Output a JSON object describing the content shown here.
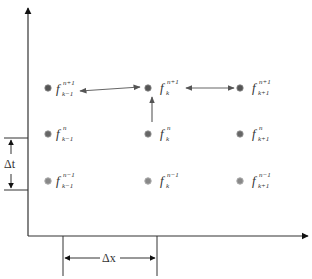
{
  "diagram": {
    "type": "finite-difference-stencil",
    "axes": {
      "vertical": {
        "label": ""
      },
      "horizontal": {
        "label": ""
      }
    },
    "colors": {
      "axis": "#333333",
      "arrow": "#555555",
      "dot_top": "#555555",
      "dot_mid": "#666666",
      "dot_bottom": "#8a8a8a"
    },
    "nodes": [
      {
        "id": "f_km1_np1",
        "base": "f",
        "sup": "n+1",
        "sub": "k−1",
        "row": "top",
        "col": "left"
      },
      {
        "id": "f_k_np1",
        "base": "f",
        "sup": "n+1",
        "sub": "k",
        "row": "top",
        "col": "center"
      },
      {
        "id": "f_kp1_np1",
        "base": "f",
        "sup": "n+1",
        "sub": "k+1",
        "row": "top",
        "col": "right"
      },
      {
        "id": "f_km1_n",
        "base": "f",
        "sup": "n",
        "sub": "k−1",
        "row": "middle",
        "col": "left"
      },
      {
        "id": "f_k_n",
        "base": "f",
        "sup": "n",
        "sub": "k",
        "row": "middle",
        "col": "center"
      },
      {
        "id": "f_kp1_n",
        "base": "f",
        "sup": "n",
        "sub": "k+1",
        "row": "middle",
        "col": "right"
      },
      {
        "id": "f_km1_nm1",
        "base": "f",
        "sup": "n−1",
        "sub": "k−1",
        "row": "bottom",
        "col": "left"
      },
      {
        "id": "f_k_nm1",
        "base": "f",
        "sup": "n−1",
        "sub": "k",
        "row": "bottom",
        "col": "center"
      },
      {
        "id": "f_kp1_nm1",
        "base": "f",
        "sup": "n−1",
        "sub": "k+1",
        "row": "bottom",
        "col": "right"
      }
    ],
    "arrows": [
      {
        "from": "f_km1_np1",
        "to": "f_k_np1",
        "style": "double-headed"
      },
      {
        "from": "f_k_np1",
        "to": "f_kp1_np1",
        "style": "double-headed"
      },
      {
        "from": "f_k_n",
        "to": "f_k_np1",
        "style": "single-headed"
      }
    ],
    "dimensions": {
      "dt_label": "Δt",
      "dx_label": "Δx"
    }
  }
}
